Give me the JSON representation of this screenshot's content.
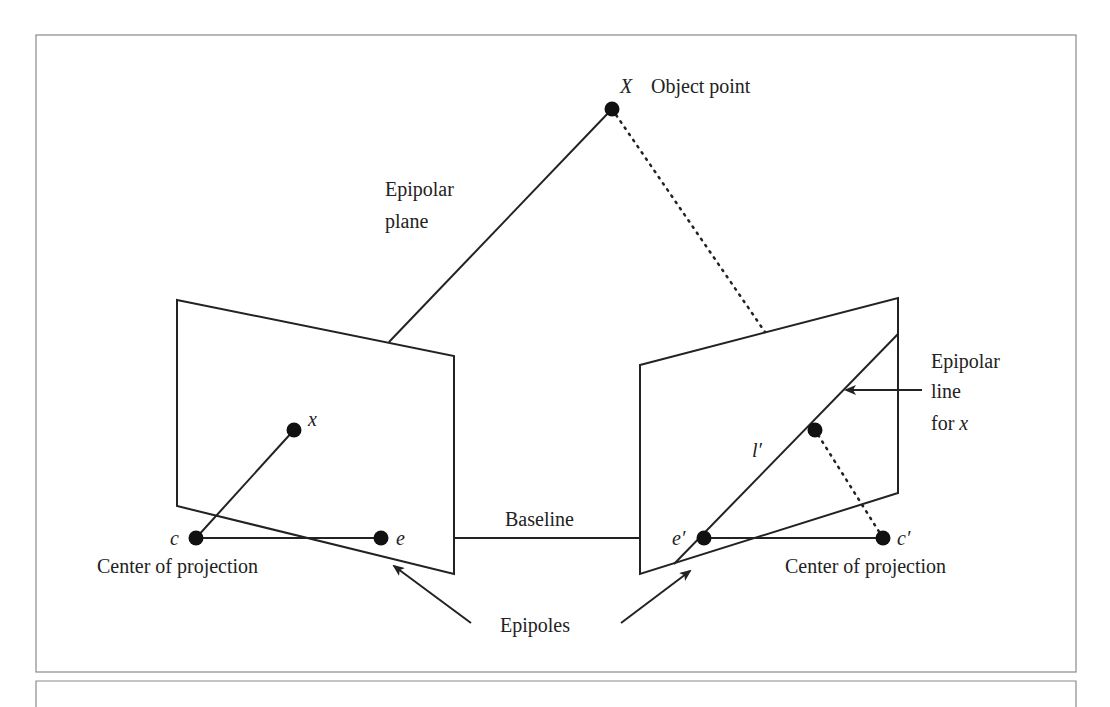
{
  "figure": {
    "labels": {
      "object_point_symbol": "X",
      "object_point": "Object point",
      "epipolar_plane_line1": "Epipolar",
      "epipolar_plane_line2": "plane",
      "image_point_x": "x",
      "center_left_symbol": "c",
      "epipole_left_symbol": "e",
      "center_of_projection_left": "Center of projection",
      "baseline": "Baseline",
      "epipole_right_symbol": "e′",
      "center_right_symbol": "c′",
      "center_of_projection_right": "Center of projection",
      "epipolar_line_symbol": "l′",
      "epipolar_line_line1": "Epipolar",
      "epipolar_line_line2": "line",
      "epipolar_line_line3_prefix": "for ",
      "epipolar_line_line3_var": "x",
      "epipoles": "Epipoles"
    },
    "colors": {
      "stroke": "#222222",
      "frame": "#8a8a8a",
      "background": "#ffffff"
    }
  }
}
